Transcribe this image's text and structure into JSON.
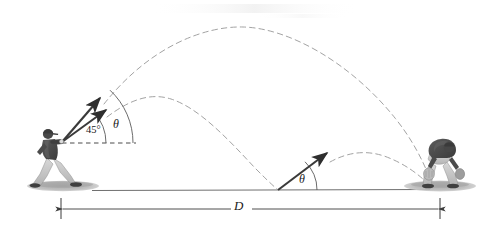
{
  "figure": {
    "caption": "",
    "background_color": "#ffffff",
    "ink_color": "#3a3a3a",
    "dash_color": "#9a9a9a",
    "jersey_color": "#4a4a4a",
    "pants_color": "#c8c8c8",
    "ground_color": "#b0b0b0"
  },
  "labels": {
    "angle_45": "45°",
    "theta_launch": "θ",
    "theta_bounce": "θ",
    "distance": "D"
  },
  "icons": {
    "thrower": "baseball-thrower-icon",
    "fielder": "baseball-fielder-icon",
    "velocity_arrow_45": "velocity-arrow-45-icon",
    "velocity_arrow_theta": "velocity-arrow-theta-icon",
    "velocity_arrow_bounce": "velocity-arrow-bounce-icon",
    "arc_high": "trajectory-arc-high-icon",
    "arc_low": "trajectory-arc-low-icon",
    "arc_bounce": "trajectory-arc-bounce-icon",
    "dimension_line": "dimension-line-D-icon",
    "horizontal_reference": "horizontal-dashed-reference-icon",
    "ground_line": "ground-line-icon"
  },
  "geometry": {
    "release_point": [
      61,
      142
    ],
    "bounce_point": [
      278,
      190
    ],
    "catch_point": [
      432,
      190
    ],
    "ground_y": 190,
    "arc_high_peak": [
      240,
      28
    ],
    "arc_low_peak": [
      168,
      100
    ],
    "arc_bounce_peak": [
      355,
      152
    ],
    "dimension_y": 209,
    "dimension_x_start": [
      61
    ],
    "dimension_x_end": [
      440
    ]
  }
}
